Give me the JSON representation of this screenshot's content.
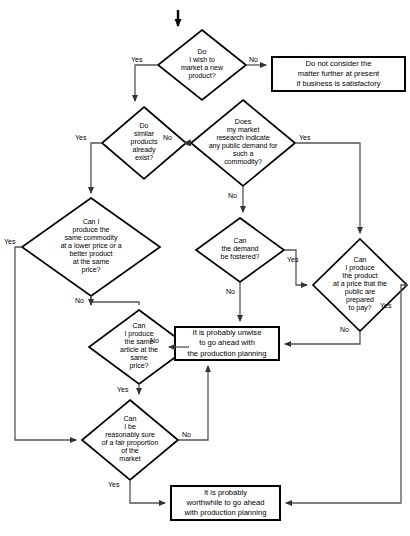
{
  "diagram": {
    "type": "flowchart",
    "colors": {
      "background": "#ffffff",
      "stroke": "#000000",
      "text": "#000000",
      "line": "#555555"
    },
    "nodes": [
      {
        "id": "start-arrow",
        "shape": "arrow",
        "label": ""
      },
      {
        "id": "d1",
        "shape": "diamond",
        "label": "Do\nI wish to\nmarket a new\nproduct?"
      },
      {
        "id": "b1",
        "shape": "rect",
        "label": "Do not consider the\nmatter further at present\nif business is satisfactory"
      },
      {
        "id": "d2",
        "shape": "diamond",
        "label": "Do\nsimilar\nproducts\nalready\nexist?"
      },
      {
        "id": "d3",
        "shape": "diamond",
        "label": "Does\nmy market\nresearch indicate\nany public demand for\nsuch a\ncommodity?"
      },
      {
        "id": "d4",
        "shape": "diamond",
        "label": "Can I\nproduce the\nsame commodity\nat a lower price or a\nbetter product\nat the same\nprice?"
      },
      {
        "id": "d5",
        "shape": "diamond",
        "label": "Can\nthe demand\nbe fostered?"
      },
      {
        "id": "d6",
        "shape": "diamond",
        "label": "Can\nI produce\nthe product\nat a price that the\npublic are\nprepared\nto pay?"
      },
      {
        "id": "d7",
        "shape": "diamond",
        "label": "Can\nI produce\nthe same\narticle at the\nsame\nprice?"
      },
      {
        "id": "b2",
        "shape": "rect",
        "label": "It is probably unwise\nto go ahead with\nthe production planning"
      },
      {
        "id": "d8",
        "shape": "diamond",
        "label": "Can\nI be\nreasonably sure\nof a fair proportion\nof the\nmarket"
      },
      {
        "id": "b3",
        "shape": "rect",
        "label": "It is probably\nworthwhile to go ahead\nwith production planning"
      }
    ],
    "edge_labels": {
      "d1_yes": "Yes",
      "d1_no": "No",
      "d2_yes": "Yes",
      "d2_no": "No",
      "d3_yes": "Yes",
      "d3_no": "No",
      "d4_yes": "Yes",
      "d4_no": "No",
      "d5_yes": "Yes",
      "d5_no": "No",
      "d6_yes": "Yes",
      "d6_no": "No",
      "d7_yes": "Yes",
      "d7_no": "No",
      "d8_yes": "Yes",
      "d8_no": "No"
    }
  }
}
